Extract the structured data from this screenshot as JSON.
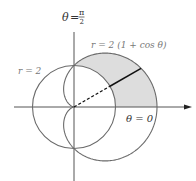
{
  "diagram": {
    "title_top_label": {
      "theta": "θ",
      "eq": "=",
      "num": "π",
      "den": "2"
    },
    "cardioid_label": "r = 2 (1 + cos θ)",
    "circle_label": "r = 2",
    "zero_label": "θ = 0",
    "colors": {
      "curve": "#6a6a6a",
      "axis": "#555555",
      "shade": "#dddddd",
      "radial": "#111111",
      "label_gray": "#777777",
      "label_dark": "#333333"
    },
    "geometry": {
      "origin": [
        74,
        107
      ],
      "unit_px": 20.75,
      "circle_radius_units": 2,
      "cardioid_a": 2,
      "radial_angle_deg": 30,
      "shade_theta_range_deg": [
        0,
        90
      ]
    },
    "curves": [
      {
        "name": "circle",
        "equation": "r = 2"
      },
      {
        "name": "cardioid",
        "equation": "r = 2(1 + cos θ)"
      }
    ]
  }
}
